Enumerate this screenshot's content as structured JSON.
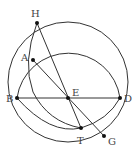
{
  "diagram": {
    "type": "geometric-construction",
    "points": [
      {
        "id": "H",
        "label": "H",
        "x": 37,
        "y": 23,
        "lx": 31,
        "ly": 17
      },
      {
        "id": "A",
        "label": "A",
        "x": 33,
        "y": 60,
        "lx": 21,
        "ly": 61
      },
      {
        "id": "B",
        "label": "B",
        "x": 17,
        "y": 98,
        "lx": 6,
        "ly": 102
      },
      {
        "id": "E",
        "label": "E",
        "x": 68,
        "y": 98,
        "lx": 72,
        "ly": 96
      },
      {
        "id": "D",
        "label": "D",
        "x": 120,
        "y": 98,
        "lx": 124,
        "ly": 102
      },
      {
        "id": "T",
        "label": "T",
        "x": 81,
        "y": 128,
        "lx": 77,
        "ly": 144
      },
      {
        "id": "G",
        "label": "G",
        "x": 104,
        "y": 136,
        "lx": 108,
        "ly": 145
      }
    ],
    "segments": [
      {
        "from": "B",
        "to": "D"
      },
      {
        "from": "H",
        "to": "T"
      },
      {
        "from": "A",
        "to": "G"
      }
    ],
    "colors": {
      "stroke": "#333333",
      "point": "#111111",
      "label": "#444444"
    }
  }
}
